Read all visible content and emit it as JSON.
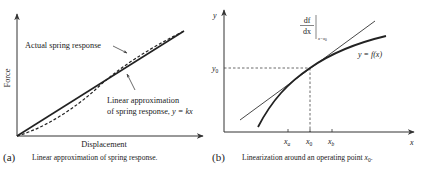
{
  "panels": [
    {
      "id": "a",
      "tag": "(a)",
      "caption": "Linear approximation of spring response.",
      "x_axis_label": "Displacement",
      "y_axis_label": "Force",
      "annotations": {
        "actual": "Actual spring response",
        "linear_line1": "Linear approximation",
        "linear_line2": "of spring response, ",
        "linear_eq": "y = kx"
      }
    },
    {
      "id": "b",
      "tag": "(b)",
      "caption": "Linearization around an operating point ",
      "caption_var": "x",
      "caption_sub": "0",
      "caption_end": ".",
      "x_axis_label": "x",
      "y_axis_label": "y",
      "y0_label": "y",
      "y0_sub": "0",
      "ticks": [
        {
          "main": "x",
          "sub": "a"
        },
        {
          "main": "x",
          "sub": "0"
        },
        {
          "main": "x",
          "sub": "b"
        }
      ],
      "curve_label": "y = f(x)",
      "derivative_label": {
        "num": "df",
        "den": "dx",
        "eval": "x=x",
        "eval_sub": "0"
      }
    }
  ],
  "colors": {
    "ink": "#222222",
    "thin_line": "#555555",
    "background": "#ffffff"
  }
}
